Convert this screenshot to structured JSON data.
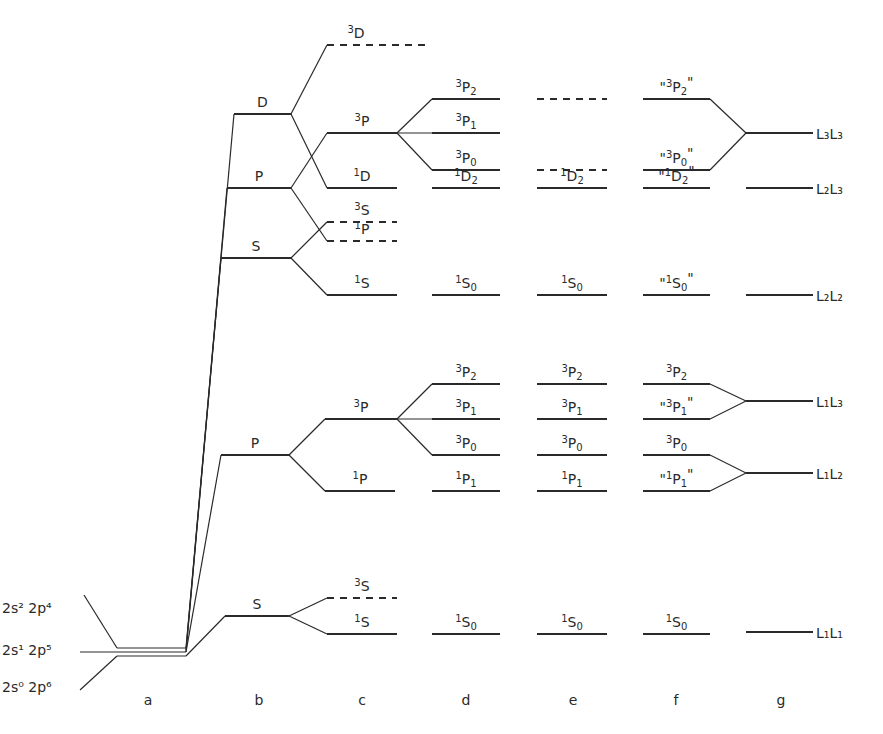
{
  "diagram": {
    "columns": [
      {
        "id": "a",
        "label": "a",
        "x": 148
      },
      {
        "id": "b",
        "label": "b",
        "x": 259
      },
      {
        "id": "c",
        "label": "c",
        "x": 362
      },
      {
        "id": "d",
        "label": "d",
        "x": 466
      },
      {
        "id": "e",
        "label": "e",
        "x": 573
      },
      {
        "id": "f",
        "label": "f",
        "x": 676
      },
      {
        "id": "g",
        "label": "g",
        "x": 781
      }
    ],
    "configurations": [
      {
        "id": "2s2-2p4",
        "text": "2s² 2p⁴",
        "label_y": 613,
        "line_y": 648
      },
      {
        "id": "2s1-2p5",
        "text": "2s¹ 2p⁵",
        "label_y": 655,
        "line_y": 652
      },
      {
        "id": "2s0-2p6",
        "text": "2s⁰ 2p⁶",
        "label_y": 692,
        "line_y": 656
      }
    ],
    "levels": {
      "b": [
        {
          "id": "b-D",
          "text": "D",
          "y": 114,
          "x1": 234,
          "x2": 291,
          "style": "solid"
        },
        {
          "id": "b-P-upper",
          "text": "P",
          "y": 188,
          "x1": 227,
          "x2": 291,
          "style": "solid"
        },
        {
          "id": "b-S-upper",
          "text": "S",
          "y": 258,
          "x1": 221,
          "x2": 291,
          "style": "solid"
        },
        {
          "id": "b-P-lower",
          "text": "P",
          "y": 455,
          "x1": 221,
          "x2": 289,
          "style": "solid"
        },
        {
          "id": "b-S-lower",
          "text": "S",
          "y": 616,
          "x1": 225,
          "x2": 289,
          "style": "solid"
        }
      ],
      "c": [
        {
          "id": "c-3D",
          "sup": "3",
          "base": "D",
          "sub": "",
          "y": 45,
          "x1": 327,
          "x2": 425,
          "style": "dashed"
        },
        {
          "id": "c-3P-upper",
          "sup": "3",
          "base": "P",
          "sub": "",
          "y": 133,
          "x1": 327,
          "x2": 397,
          "style": "solid"
        },
        {
          "id": "c-1D",
          "sup": "1",
          "base": "D",
          "sub": "",
          "y": 188,
          "x1": 327,
          "x2": 397,
          "style": "solid"
        },
        {
          "id": "c-3S-upper",
          "sup": "3",
          "base": "S",
          "sub": "",
          "y": 222,
          "x1": 327,
          "x2": 397,
          "style": "dashed"
        },
        {
          "id": "c-1P-upper",
          "sup": "1",
          "base": "P",
          "sub": "",
          "y": 241,
          "x1": 327,
          "x2": 397,
          "style": "dashed"
        },
        {
          "id": "c-1S-upper",
          "sup": "1",
          "base": "S",
          "sub": "",
          "y": 295,
          "x1": 327,
          "x2": 397,
          "style": "solid"
        },
        {
          "id": "c-3P-lower",
          "sup": "3",
          "base": "P",
          "sub": "",
          "y": 419,
          "x1": 325,
          "x2": 397,
          "style": "solid"
        },
        {
          "id": "c-1P-lower",
          "sup": "1",
          "base": "P",
          "sub": "",
          "y": 491,
          "x1": 325,
          "x2": 395,
          "style": "solid"
        },
        {
          "id": "c-3S-lower",
          "sup": "3",
          "base": "S",
          "sub": "",
          "y": 598,
          "x1": 327,
          "x2": 397,
          "style": "dashed"
        },
        {
          "id": "c-1S-lower",
          "sup": "1",
          "base": "S",
          "sub": "",
          "y": 634,
          "x1": 327,
          "x2": 397,
          "style": "solid"
        }
      ],
      "d": [
        {
          "id": "d-3P2-upper",
          "sup": "3",
          "base": "P",
          "sub": "2",
          "y": 99,
          "x1": 432,
          "x2": 500,
          "style": "solid"
        },
        {
          "id": "d-3P1-upper",
          "sup": "3",
          "base": "P",
          "sub": "1",
          "y": 133,
          "x1": 432,
          "x2": 500,
          "style": "solid"
        },
        {
          "id": "d-3P0-upper",
          "sup": "3",
          "base": "P",
          "sub": "0",
          "y": 170,
          "x1": 432,
          "x2": 500,
          "style": "solid"
        },
        {
          "id": "d-1D2",
          "sup": "1",
          "base": "D",
          "sub": "2",
          "y": 188,
          "x1": 432,
          "x2": 500,
          "style": "solid"
        },
        {
          "id": "d-1S0-upper",
          "sup": "1",
          "base": "S",
          "sub": "0",
          "y": 295,
          "x1": 432,
          "x2": 500,
          "style": "solid"
        },
        {
          "id": "d-3P2-lower",
          "sup": "3",
          "base": "P",
          "sub": "2",
          "y": 384,
          "x1": 432,
          "x2": 500,
          "style": "solid"
        },
        {
          "id": "d-3P1-lower",
          "sup": "3",
          "base": "P",
          "sub": "1",
          "y": 419,
          "x1": 432,
          "x2": 500,
          "style": "solid"
        },
        {
          "id": "d-3P0-lower",
          "sup": "3",
          "base": "P",
          "sub": "0",
          "y": 455,
          "x1": 432,
          "x2": 500,
          "style": "solid"
        },
        {
          "id": "d-1P1",
          "sup": "1",
          "base": "P",
          "sub": "1",
          "y": 491,
          "x1": 432,
          "x2": 500,
          "style": "solid"
        },
        {
          "id": "d-1S0-lower",
          "sup": "1",
          "base": "S",
          "sub": "0",
          "y": 634,
          "x1": 432,
          "x2": 500,
          "style": "solid"
        }
      ],
      "e": [
        {
          "id": "e-dashed-top",
          "sup": "",
          "base": "",
          "sub": "",
          "y": 99,
          "x1": 537,
          "x2": 607,
          "style": "dashed"
        },
        {
          "id": "e-dashed-mid",
          "sup": "",
          "base": "",
          "sub": "",
          "y": 170,
          "x1": 537,
          "x2": 607,
          "style": "dashed"
        },
        {
          "id": "e-1D2",
          "sup": "1",
          "base": "D",
          "sub": "2",
          "y": 188,
          "x1": 537,
          "x2": 607,
          "style": "solid"
        },
        {
          "id": "e-1S0-upper",
          "sup": "1",
          "base": "S",
          "sub": "0",
          "y": 295,
          "x1": 537,
          "x2": 607,
          "style": "solid"
        },
        {
          "id": "e-3P2",
          "sup": "3",
          "base": "P",
          "sub": "2",
          "y": 384,
          "x1": 537,
          "x2": 607,
          "style": "solid"
        },
        {
          "id": "e-3P1",
          "sup": "3",
          "base": "P",
          "sub": "1",
          "y": 419,
          "x1": 537,
          "x2": 607,
          "style": "solid"
        },
        {
          "id": "e-3P0",
          "sup": "3",
          "base": "P",
          "sub": "0",
          "y": 455,
          "x1": 537,
          "x2": 607,
          "style": "solid"
        },
        {
          "id": "e-1P1",
          "sup": "1",
          "base": "P",
          "sub": "1",
          "y": 491,
          "x1": 537,
          "x2": 607,
          "style": "solid"
        },
        {
          "id": "e-1S0-lower",
          "sup": "1",
          "base": "S",
          "sub": "0",
          "y": 634,
          "x1": 537,
          "x2": 607,
          "style": "solid"
        }
      ],
      "f": [
        {
          "id": "f-3P2-upper",
          "sup": "3",
          "base": "P",
          "sub": "2",
          "quoted": true,
          "y": 99,
          "x1": 643,
          "x2": 710,
          "style": "solid"
        },
        {
          "id": "f-3P0-upper",
          "sup": "3",
          "base": "P",
          "sub": "0",
          "quoted": true,
          "y": 170,
          "x1": 643,
          "x2": 710,
          "style": "solid"
        },
        {
          "id": "f-1D2",
          "sup": "1",
          "base": "D",
          "sub": "2",
          "quoted": true,
          "y": 188,
          "x1": 643,
          "x2": 710,
          "style": "solid"
        },
        {
          "id": "f-1S0-upper",
          "sup": "1",
          "base": "S",
          "sub": "0",
          "quoted": true,
          "y": 295,
          "x1": 643,
          "x2": 710,
          "style": "solid"
        },
        {
          "id": "f-3P2-lower",
          "sup": "3",
          "base": "P",
          "sub": "2",
          "quoted": false,
          "y": 384,
          "x1": 643,
          "x2": 710,
          "style": "solid"
        },
        {
          "id": "f-3P1",
          "sup": "3",
          "base": "P",
          "sub": "1",
          "quoted": true,
          "y": 419,
          "x1": 643,
          "x2": 710,
          "style": "solid"
        },
        {
          "id": "f-3P0-lower",
          "sup": "3",
          "base": "P",
          "sub": "0",
          "quoted": false,
          "y": 455,
          "x1": 643,
          "x2": 710,
          "style": "solid"
        },
        {
          "id": "f-1P1",
          "sup": "1",
          "base": "P",
          "sub": "1",
          "quoted": true,
          "y": 491,
          "x1": 643,
          "x2": 710,
          "style": "solid"
        },
        {
          "id": "f-1S0-lower",
          "sup": "1",
          "base": "S",
          "sub": "0",
          "quoted": false,
          "y": 634,
          "x1": 643,
          "x2": 710,
          "style": "solid"
        }
      ],
      "g": [
        {
          "id": "g-L3L3",
          "text": "L₃L₃",
          "y": 133,
          "x1": 746,
          "x2": 813,
          "style": "solid"
        },
        {
          "id": "g-L2L3",
          "text": "L₂L₃",
          "y": 188,
          "x1": 746,
          "x2": 813,
          "style": "solid"
        },
        {
          "id": "g-L2L2",
          "text": "L₂L₂",
          "y": 295,
          "x1": 746,
          "x2": 813,
          "style": "solid"
        },
        {
          "id": "g-L1L3",
          "text": "L₁L₃",
          "y": 401,
          "x1": 746,
          "x2": 813,
          "style": "solid"
        },
        {
          "id": "g-L1L2",
          "text": "L₁L₂",
          "y": 473,
          "x1": 746,
          "x2": 813,
          "style": "solid"
        },
        {
          "id": "g-L1L1",
          "text": "L₁L₁",
          "y": 632,
          "x1": 746,
          "x2": 813,
          "style": "solid"
        }
      ]
    },
    "connectors": [
      [
        84,
        595,
        117,
        648
      ],
      [
        80,
        652,
        117,
        652
      ],
      [
        80,
        690,
        117,
        656
      ],
      [
        117,
        648,
        186,
        648
      ],
      [
        117,
        652,
        186,
        652
      ],
      [
        117,
        656,
        186,
        656
      ],
      [
        186,
        648,
        234,
        114
      ],
      [
        186,
        650,
        227,
        188
      ],
      [
        186,
        652,
        221,
        258
      ],
      [
        186,
        652,
        221,
        455
      ],
      [
        186,
        656,
        225,
        616
      ],
      [
        291,
        114,
        327,
        45
      ],
      [
        291,
        114,
        327,
        188
      ],
      [
        291,
        188,
        327,
        133
      ],
      [
        291,
        188,
        327,
        241
      ],
      [
        291,
        258,
        327,
        222
      ],
      [
        291,
        258,
        327,
        295
      ],
      [
        289,
        455,
        325,
        419
      ],
      [
        289,
        455,
        325,
        491
      ],
      [
        289,
        616,
        327,
        598
      ],
      [
        289,
        616,
        327,
        634
      ],
      [
        397,
        133,
        432,
        99
      ],
      [
        397,
        133,
        432,
        133
      ],
      [
        397,
        133,
        432,
        170
      ],
      [
        397,
        419,
        432,
        384
      ],
      [
        397,
        419,
        432,
        419
      ],
      [
        397,
        419,
        432,
        455
      ],
      [
        710,
        99,
        746,
        133
      ],
      [
        710,
        170,
        746,
        133
      ],
      [
        710,
        384,
        746,
        401
      ],
      [
        710,
        419,
        746,
        401
      ],
      [
        710,
        455,
        746,
        473
      ],
      [
        710,
        491,
        746,
        473
      ]
    ]
  }
}
